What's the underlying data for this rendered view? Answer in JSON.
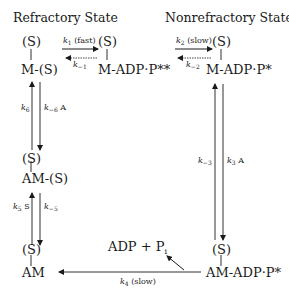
{
  "headers": {
    "refractory": "Refractory State",
    "nonrefractory": "Nonrefractory State"
  },
  "species": {
    "s_top_left": "(S)",
    "m_s": "M-(S)",
    "s_top_mid": "(S)",
    "m_adp_p_double": "M-ADP·P**",
    "s_top_right": "(S)",
    "m_adp_p_star": "M-ADP·P*",
    "s_mid_left": "(S)",
    "am_s": "AM-(S)",
    "s_bottom_left": "(S)",
    "am": "AM",
    "s_bottom_right": "(S)",
    "am_adp_p_star": "AM-ADP·P*",
    "products_adp": "ADP + P",
    "products_sub": "i"
  },
  "rates": {
    "k1": {
      "k": "k",
      "sub": "1",
      "tail": " (fast)"
    },
    "k_minus1": {
      "k": "k",
      "sub": "−1",
      "tail": ""
    },
    "k2": {
      "k": "k",
      "sub": "2",
      "tail": " (slow)"
    },
    "k_minus2": {
      "k": "k",
      "sub": "−2",
      "tail": ""
    },
    "k6": {
      "k": "k",
      "sub": "6",
      "tail": ""
    },
    "k_minus6": {
      "k": "k",
      "sub": "−6",
      "tail": " A"
    },
    "k5": {
      "k": "k",
      "sub": "5",
      "tail": " S"
    },
    "k_minus5": {
      "k": "k",
      "sub": "−5",
      "tail": ""
    },
    "k_minus3": {
      "k": "k",
      "sub": "−3",
      "tail": ""
    },
    "k3": {
      "k": "k",
      "sub": "3",
      "tail": " A"
    },
    "k4": {
      "k": "k",
      "sub": "4",
      "tail": " (slow)"
    }
  },
  "colors": {
    "ink": "#1a1a1a",
    "background": "#ffffff"
  }
}
